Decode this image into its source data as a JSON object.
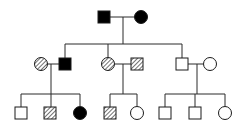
{
  "diagram": {
    "type": "pedigree",
    "colors": {
      "line": "#2a2a2a",
      "affected": "#000000",
      "background": "#ffffff"
    },
    "legend_states": [
      "unaffected",
      "carrier-hatched",
      "affected"
    ],
    "generations": [
      {
        "id": "I",
        "individuals": [
          {
            "id": "I-1",
            "sex": "male",
            "status": "affected",
            "cx": 104,
            "cy": 17
          },
          {
            "id": "I-2",
            "sex": "female",
            "status": "affected",
            "cx": 141,
            "cy": 17
          }
        ]
      },
      {
        "id": "II",
        "individuals": [
          {
            "id": "II-1",
            "sex": "female",
            "status": "carrier",
            "cx": 41,
            "cy": 64
          },
          {
            "id": "II-2",
            "sex": "male",
            "status": "affected",
            "cx": 65,
            "cy": 64
          },
          {
            "id": "II-3",
            "sex": "female",
            "status": "carrier",
            "cx": 108,
            "cy": 64
          },
          {
            "id": "II-4",
            "sex": "male",
            "status": "carrier",
            "cx": 137,
            "cy": 64
          },
          {
            "id": "II-5",
            "sex": "male",
            "status": "unaffected",
            "cx": 182,
            "cy": 64
          },
          {
            "id": "II-6",
            "sex": "female",
            "status": "unaffected",
            "cx": 210,
            "cy": 64
          }
        ]
      },
      {
        "id": "III",
        "individuals": [
          {
            "id": "III-1",
            "sex": "male",
            "status": "unaffected",
            "cx": 21,
            "cy": 113
          },
          {
            "id": "III-2",
            "sex": "male",
            "status": "carrier",
            "cx": 50,
            "cy": 113
          },
          {
            "id": "III-3",
            "sex": "female",
            "status": "affected",
            "cx": 80,
            "cy": 113
          },
          {
            "id": "III-4",
            "sex": "male",
            "status": "carrier",
            "cx": 110,
            "cy": 113
          },
          {
            "id": "III-5",
            "sex": "female",
            "status": "unaffected",
            "cx": 137,
            "cy": 113
          },
          {
            "id": "III-6",
            "sex": "male",
            "status": "unaffected",
            "cx": 165,
            "cy": 113
          },
          {
            "id": "III-7",
            "sex": "male",
            "status": "unaffected",
            "cx": 195,
            "cy": 113
          },
          {
            "id": "III-8",
            "sex": "female",
            "status": "unaffected",
            "cx": 225,
            "cy": 113
          }
        ]
      }
    ]
  }
}
